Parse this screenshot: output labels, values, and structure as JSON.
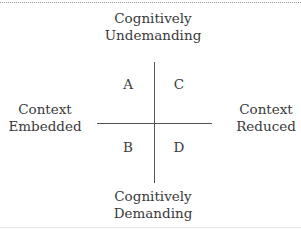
{
  "diagram": {
    "type": "quadrant",
    "axes": {
      "vertical": {
        "top": [
          "Cognitively",
          "Undemanding"
        ],
        "bottom": [
          "Cognitively",
          "Demanding"
        ]
      },
      "horizontal": {
        "left": [
          "Context",
          "Embedded"
        ],
        "right": [
          "Context",
          "Reduced"
        ]
      }
    },
    "quadrants": {
      "top_left": "A",
      "top_right": "C",
      "bottom_left": "B",
      "bottom_right": "D"
    }
  },
  "colors": {
    "text": "#3a3a3a",
    "lines": "#555555",
    "background": "#ffffff"
  }
}
